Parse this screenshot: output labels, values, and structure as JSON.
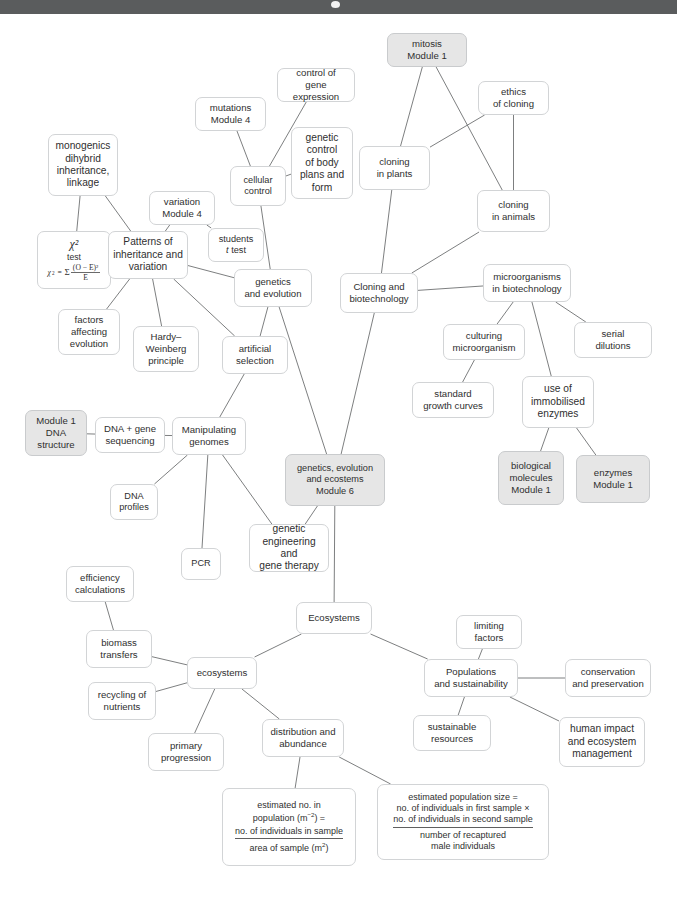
{
  "window": {
    "titlebar_color": "#5a5c5d",
    "indicator": "camera-dot"
  },
  "diagram": {
    "type": "concept-map",
    "nodes": [
      {
        "id": "mitosis",
        "label": "mitosis\nModule 1",
        "shaded": true,
        "x": 387,
        "y": 19,
        "w": 80,
        "h": 34
      },
      {
        "id": "control-gene-expression",
        "label": "control of\ngene expression",
        "shaded": false,
        "x": 277,
        "y": 54,
        "w": 78,
        "h": 34
      },
      {
        "id": "ethics-cloning",
        "label": "ethics\nof cloning",
        "shaded": false,
        "x": 478,
        "y": 67,
        "w": 71,
        "h": 34
      },
      {
        "id": "mutations-module4",
        "label": "mutations\nModule 4",
        "shaded": false,
        "x": 195,
        "y": 83,
        "w": 71,
        "h": 34
      },
      {
        "id": "genetic-control-body",
        "label": "genetic\ncontrol\nof body\nplans and\nform",
        "shaded": false,
        "x": 291,
        "y": 113,
        "w": 62,
        "h": 72
      },
      {
        "id": "monogenics",
        "label": "monogenics\ndihybrid\ninheritance,\nlinkage",
        "shaded": false,
        "x": 48,
        "y": 120,
        "w": 70,
        "h": 62
      },
      {
        "id": "cloning-plants",
        "label": "cloning\nin plants",
        "shaded": false,
        "x": 359,
        "y": 132,
        "w": 71,
        "h": 44
      },
      {
        "id": "cellular-control",
        "label": "cellular\ncontrol",
        "shaded": false,
        "x": 230,
        "y": 152,
        "w": 56,
        "h": 40
      },
      {
        "id": "variation-module4",
        "label": "variation\nModule 4",
        "shaded": false,
        "x": 149,
        "y": 177,
        "w": 66,
        "h": 34
      },
      {
        "id": "cloning-animals",
        "label": "cloning\nin animals",
        "shaded": false,
        "x": 477,
        "y": 176,
        "w": 73,
        "h": 42
      },
      {
        "id": "students-t-test",
        "label": "students\nt test",
        "shaded": false,
        "x": 208,
        "y": 214,
        "w": 56,
        "h": 34
      },
      {
        "id": "chi-squared",
        "label": "χ²\ntest\nχ² = Σ (O − E)² / E",
        "shaded": false,
        "x": 37,
        "y": 217,
        "w": 74,
        "h": 58,
        "is_formula": true
      },
      {
        "id": "patterns-inheritance",
        "label": "Patterns of\ninheritance and\nvariation",
        "shaded": false,
        "x": 108,
        "y": 217,
        "w": 80,
        "h": 48
      },
      {
        "id": "genetics-evolution",
        "label": "genetics\nand evolution",
        "shaded": false,
        "x": 234,
        "y": 255,
        "w": 78,
        "h": 38
      },
      {
        "id": "microorganisms-biotech",
        "label": "microorganisms\nin biotechnology",
        "shaded": false,
        "x": 483,
        "y": 250,
        "w": 88,
        "h": 38
      },
      {
        "id": "cloning-biotechnology",
        "label": "Cloning and\nbiotechnology",
        "shaded": false,
        "x": 340,
        "y": 259,
        "w": 78,
        "h": 40
      },
      {
        "id": "factors-affecting-evolution",
        "label": "factors\naffecting\nevolution",
        "shaded": false,
        "x": 58,
        "y": 295,
        "w": 62,
        "h": 46
      },
      {
        "id": "hardy-weinberg",
        "label": "Hardy–\nWeinberg\nprinciple",
        "shaded": false,
        "x": 133,
        "y": 312,
        "w": 66,
        "h": 46
      },
      {
        "id": "culturing-microorganism",
        "label": "culturing\nmicroorganism",
        "shaded": false,
        "x": 443,
        "y": 310,
        "w": 82,
        "h": 36
      },
      {
        "id": "serial-dilutions",
        "label": "serial\ndilutions",
        "shaded": false,
        "x": 574,
        "y": 308,
        "w": 78,
        "h": 36
      },
      {
        "id": "artificial-selection",
        "label": "artificial\nselection",
        "shaded": false,
        "x": 222,
        "y": 322,
        "w": 66,
        "h": 38
      },
      {
        "id": "use-immobilised-enzymes",
        "label": "use of\nimmobilised\nenzymes",
        "shaded": false,
        "x": 522,
        "y": 362,
        "w": 72,
        "h": 52
      },
      {
        "id": "standard-growth-curves",
        "label": "standard\ngrowth curves",
        "shaded": false,
        "x": 412,
        "y": 368,
        "w": 82,
        "h": 36
      },
      {
        "id": "module1-dna-structure",
        "label": "Module 1\nDNA\nstructure",
        "shaded": true,
        "x": 25,
        "y": 396,
        "w": 62,
        "h": 46
      },
      {
        "id": "dna-gene-sequencing",
        "label": "DNA + gene\nsequencing",
        "shaded": false,
        "x": 95,
        "y": 403,
        "w": 70,
        "h": 36
      },
      {
        "id": "manipulating-genomes",
        "label": "Manipulating\ngenomes",
        "shaded": false,
        "x": 172,
        "y": 403,
        "w": 74,
        "h": 38
      },
      {
        "id": "biological-molecules",
        "label": "biological\nmolecules\nModule 1",
        "shaded": true,
        "x": 498,
        "y": 437,
        "w": 66,
        "h": 54
      },
      {
        "id": "enzymes-module1",
        "label": "enzymes\nModule 1",
        "shaded": true,
        "x": 576,
        "y": 441,
        "w": 74,
        "h": 48
      },
      {
        "id": "genetics-evolution-ecosystems",
        "label": "genetics, evolution\nand ecostems\nModule 6",
        "shaded": true,
        "x": 285,
        "y": 440,
        "w": 100,
        "h": 52
      },
      {
        "id": "dna-profiles",
        "label": "DNA\nprofiles",
        "shaded": false,
        "x": 110,
        "y": 470,
        "w": 48,
        "h": 36
      },
      {
        "id": "genetic-engineering-gene-therapy",
        "label": "genetic\nengineering and\ngene therapy",
        "shaded": false,
        "x": 249,
        "y": 510,
        "w": 80,
        "h": 48
      },
      {
        "id": "pcr",
        "label": "PCR",
        "shaded": false,
        "x": 181,
        "y": 534,
        "w": 40,
        "h": 32
      },
      {
        "id": "efficiency-calculations",
        "label": "efficiency\ncalculations",
        "shaded": false,
        "x": 66,
        "y": 552,
        "w": 68,
        "h": 36
      },
      {
        "id": "ecosystems-main",
        "label": "Ecosystems",
        "shaded": false,
        "x": 296,
        "y": 588,
        "w": 76,
        "h": 32
      },
      {
        "id": "limiting-factors",
        "label": "limiting\nfactors",
        "shaded": false,
        "x": 456,
        "y": 601,
        "w": 66,
        "h": 34
      },
      {
        "id": "biomass-transfers",
        "label": "biomass\ntransfers",
        "shaded": false,
        "x": 86,
        "y": 616,
        "w": 66,
        "h": 38
      },
      {
        "id": "ecosystems-sub",
        "label": "ecosystems",
        "shaded": false,
        "x": 187,
        "y": 643,
        "w": 70,
        "h": 32
      },
      {
        "id": "populations-sustainability",
        "label": "Populations\nand sustainability",
        "shaded": false,
        "x": 424,
        "y": 645,
        "w": 94,
        "h": 38
      },
      {
        "id": "conservation-preservation",
        "label": "conservation\nand preservation",
        "shaded": false,
        "x": 565,
        "y": 645,
        "w": 86,
        "h": 38
      },
      {
        "id": "recycling-nutrients",
        "label": "recycling of\nnutrients",
        "shaded": false,
        "x": 88,
        "y": 668,
        "w": 68,
        "h": 38
      },
      {
        "id": "distribution-abundance",
        "label": "distribution and\nabundance",
        "shaded": false,
        "x": 262,
        "y": 705,
        "w": 82,
        "h": 38
      },
      {
        "id": "sustainable-resources",
        "label": "sustainable\nresources",
        "shaded": false,
        "x": 413,
        "y": 701,
        "w": 78,
        "h": 36
      },
      {
        "id": "human-impact",
        "label": "human impact\nand ecosystem\nmanagement",
        "shaded": false,
        "x": 559,
        "y": 703,
        "w": 86,
        "h": 50
      },
      {
        "id": "primary-progression",
        "label": "primary\nprogression",
        "shaded": false,
        "x": 148,
        "y": 719,
        "w": 76,
        "h": 38
      },
      {
        "id": "estimated-no-population",
        "label": "estimated no. in\npopulation (m⁻²) =\nno. of individuals in sample / area of sample (m²)",
        "shaded": false,
        "x": 222,
        "y": 774,
        "w": 134,
        "h": 78,
        "is_formula": true
      },
      {
        "id": "estimated-population-size",
        "label": "estimated population size =\nno. of individuals in first sample × no. of individuals in second sample / number of recaptured male individuals",
        "shaded": false,
        "x": 377,
        "y": 770,
        "w": 172,
        "h": 76,
        "is_formula": true
      }
    ],
    "formulas": {
      "chi_squared": {
        "symbol": "χ²",
        "word": "test",
        "equation_lhs": "χ² = Σ",
        "numerator": "(O − E)²",
        "denominator": "E"
      },
      "estimated_no_in_population": {
        "line1": "estimated no. in",
        "line2_prefix": "population (m",
        "line2_exp": "−2",
        "line2_suffix": ") =",
        "numerator": "no. of individuals in sample",
        "denominator_prefix": "area of sample (m",
        "denominator_exp": "2",
        "denominator_suffix": ")"
      },
      "estimated_population_size": {
        "line1": "estimated population size =",
        "numerator_line1": "no. of individuals in first sample ×",
        "numerator_line2": "no. of individuals in second sample",
        "denominator_line1": "number of recaptured",
        "denominator_line2": "male individuals"
      }
    },
    "edges": [
      [
        "mitosis",
        "cloning-plants"
      ],
      [
        "mitosis",
        "cloning-animals"
      ],
      [
        "ethics-cloning",
        "cloning-plants"
      ],
      [
        "ethics-cloning",
        "cloning-animals"
      ],
      [
        "control-gene-expression",
        "cellular-control"
      ],
      [
        "genetic-control-body",
        "cellular-control"
      ],
      [
        "mutations-module4",
        "cellular-control"
      ],
      [
        "cellular-control",
        "genetics-evolution"
      ],
      [
        "monogenics",
        "patterns-inheritance"
      ],
      [
        "monogenics",
        "chi-squared"
      ],
      [
        "variation-module4",
        "patterns-inheritance"
      ],
      [
        "variation-module4",
        "students-t-test"
      ],
      [
        "chi-squared",
        "patterns-inheritance"
      ],
      [
        "patterns-inheritance",
        "factors-affecting-evolution"
      ],
      [
        "patterns-inheritance",
        "hardy-weinberg"
      ],
      [
        "patterns-inheritance",
        "artificial-selection"
      ],
      [
        "patterns-inheritance",
        "genetics-evolution"
      ],
      [
        "genetics-evolution",
        "artificial-selection"
      ],
      [
        "genetics-evolution",
        "genetics-evolution-ecosystems"
      ],
      [
        "artificial-selection",
        "manipulating-genomes"
      ],
      [
        "cloning-plants",
        "cloning-biotechnology"
      ],
      [
        "cloning-animals",
        "cloning-biotechnology"
      ],
      [
        "cloning-biotechnology",
        "microorganisms-biotech"
      ],
      [
        "cloning-biotechnology",
        "genetics-evolution-ecosystems"
      ],
      [
        "microorganisms-biotech",
        "culturing-microorganism"
      ],
      [
        "microorganisms-biotech",
        "serial-dilutions"
      ],
      [
        "microorganisms-biotech",
        "use-immobilised-enzymes"
      ],
      [
        "culturing-microorganism",
        "standard-growth-curves"
      ],
      [
        "use-immobilised-enzymes",
        "biological-molecules"
      ],
      [
        "use-immobilised-enzymes",
        "enzymes-module1"
      ],
      [
        "module1-dna-structure",
        "dna-gene-sequencing"
      ],
      [
        "dna-gene-sequencing",
        "manipulating-genomes"
      ],
      [
        "manipulating-genomes",
        "dna-profiles"
      ],
      [
        "manipulating-genomes",
        "pcr"
      ],
      [
        "manipulating-genomes",
        "genetic-engineering-gene-therapy"
      ],
      [
        "genetics-evolution-ecosystems",
        "genetic-engineering-gene-therapy"
      ],
      [
        "genetics-evolution-ecosystems",
        "ecosystems-main"
      ],
      [
        "ecosystems-main",
        "ecosystems-sub"
      ],
      [
        "ecosystems-main",
        "populations-sustainability"
      ],
      [
        "efficiency-calculations",
        "biomass-transfers"
      ],
      [
        "biomass-transfers",
        "ecosystems-sub"
      ],
      [
        "recycling-nutrients",
        "ecosystems-sub"
      ],
      [
        "ecosystems-sub",
        "primary-progression"
      ],
      [
        "ecosystems-sub",
        "distribution-abundance"
      ],
      [
        "limiting-factors",
        "populations-sustainability"
      ],
      [
        "populations-sustainability",
        "conservation-preservation"
      ],
      [
        "populations-sustainability",
        "sustainable-resources"
      ],
      [
        "populations-sustainability",
        "human-impact"
      ],
      [
        "distribution-abundance",
        "estimated-no-population"
      ],
      [
        "distribution-abundance",
        "estimated-population-size"
      ]
    ]
  }
}
